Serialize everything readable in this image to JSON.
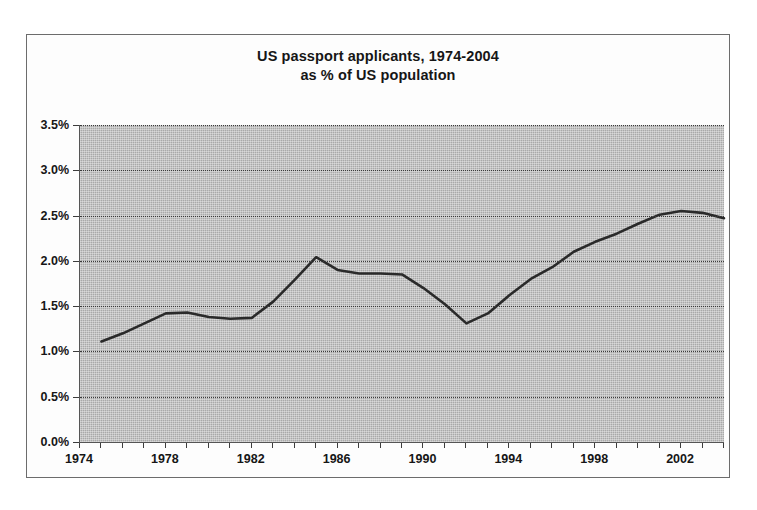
{
  "page": {
    "scan_fragment": "passport applicants as % of US population (2004 est.)"
  },
  "figure": {
    "title_line1": "US passport applicants, 1974-2004",
    "title_line2": "as % of US population"
  },
  "axes": {
    "y_ticks": [
      "0.0%",
      "0.5%",
      "1.0%",
      "1.5%",
      "2.0%",
      "2.5%",
      "3.0%",
      "3.5%"
    ],
    "x_ticks": [
      "1974",
      "1978",
      "1982",
      "1986",
      "1990",
      "1994",
      "1998",
      "2002"
    ]
  },
  "colors": {
    "plot_background": "#a9a9a9",
    "line": "#2a2a2a",
    "gridline": "#3b3b3b",
    "frame": "#6c6c6c",
    "text": "#161616"
  },
  "chart_data": {
    "type": "line",
    "title": "US passport applicants, 1974-2004 as % of US population",
    "xlabel": "",
    "ylabel": "",
    "xlim": [
      1974,
      2004
    ],
    "ylim": [
      0.0,
      3.5
    ],
    "ytick_values": [
      0.0,
      0.5,
      1.0,
      1.5,
      2.0,
      2.5,
      3.0,
      3.5
    ],
    "ytick_labels": [
      "0.0%",
      "0.5%",
      "1.0%",
      "1.5%",
      "2.0%",
      "2.5%",
      "3.0%",
      "3.5%"
    ],
    "xtick_values": [
      1974,
      1978,
      1982,
      1986,
      1990,
      1994,
      1998,
      2002
    ],
    "xtick_labels": [
      "1974",
      "1978",
      "1982",
      "1986",
      "1990",
      "1994",
      "1998",
      "2002"
    ],
    "x_minor_tick_interval": 1,
    "grid": "horizontal-dotted",
    "legend": "none",
    "units": "percent",
    "x": [
      1975,
      1976,
      1977,
      1978,
      1979,
      1980,
      1981,
      1982,
      1983,
      1984,
      1985,
      1986,
      1987,
      1988,
      1989,
      1990,
      1991,
      1992,
      1993,
      1994,
      1995,
      1996,
      1997,
      1998,
      1999,
      2000,
      2001,
      2002,
      2003,
      2004
    ],
    "series": [
      {
        "name": "US passport applicants as % of US population",
        "values": [
          1.11,
          1.2,
          1.31,
          1.42,
          1.43,
          1.38,
          1.36,
          1.37,
          1.55,
          1.79,
          2.04,
          1.9,
          1.86,
          1.86,
          1.85,
          1.7,
          1.52,
          1.31,
          1.42,
          1.62,
          1.8,
          1.93,
          2.1,
          2.21,
          2.3,
          2.41,
          2.51,
          2.55,
          2.53,
          2.47
        ]
      }
    ],
    "annotations": [
      {
        "text": "local peak",
        "x": 1985,
        "y": 2.04
      },
      {
        "text": "trough",
        "x": 1992,
        "y": 1.31
      },
      {
        "text": "series end",
        "x": 2004,
        "y": 2.7
      }
    ]
  }
}
